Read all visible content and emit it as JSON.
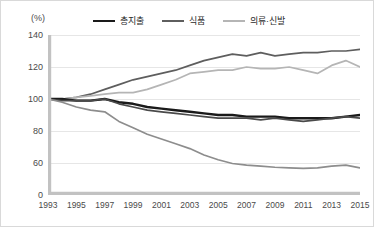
{
  "unit_label": "(%)",
  "legend": {
    "items": [
      {
        "label": "총지출",
        "color": "#1a1a1a",
        "width": 2.6
      },
      {
        "label": "식품",
        "color": "#5e5e5e",
        "width": 2.2
      },
      {
        "label": "의류·신발",
        "color": "#b5b5b5",
        "width": 2.0
      }
    ]
  },
  "axis": {
    "y_ticks": [
      "140",
      "120",
      "100",
      "80",
      "60",
      "0"
    ],
    "x_ticks": [
      "1993",
      "1995",
      "1997",
      "1999",
      "2001",
      "2003",
      "2005",
      "2007",
      "2009",
      "2011",
      "2013",
      "2015"
    ]
  },
  "chart_data": {
    "type": "line",
    "title": "",
    "subtitle": "",
    "xlabel": "",
    "ylabel": "(%)",
    "grid": true,
    "legend_position": "top",
    "ylim": [
      0,
      140
    ],
    "y_tick_values": [
      140,
      120,
      100,
      80,
      60,
      0
    ],
    "y_axis_note": "broken axis: ticks 140,120,100,80,60,0 are drawn at equal spacing",
    "x": [
      1993,
      1994,
      1995,
      1996,
      1997,
      1998,
      1999,
      2000,
      2001,
      2002,
      2003,
      2004,
      2005,
      2006,
      2007,
      2008,
      2009,
      2010,
      2011,
      2012,
      2013,
      2014,
      2015
    ],
    "x_tick_values": [
      1993,
      1995,
      1997,
      1999,
      2001,
      2003,
      2005,
      2007,
      2009,
      2011,
      2013,
      2015
    ],
    "series": [
      {
        "name": "주거·수도·광열",
        "color": "#5e5e5e",
        "labeled_in_legend": false,
        "values": [
          100,
          100,
          101,
          103,
          106,
          109,
          112,
          114,
          116,
          118,
          121,
          124,
          126,
          128,
          127,
          129,
          127,
          128,
          129,
          129,
          130,
          130,
          131
        ]
      },
      {
        "name": "식품",
        "color": "#b5b5b5",
        "labeled_in_legend": true,
        "values": [
          100,
          100,
          101,
          102,
          103,
          104,
          104,
          106,
          109,
          112,
          116,
          117,
          118,
          118,
          120,
          119,
          119,
          120,
          118,
          116,
          121,
          124,
          120
        ]
      },
      {
        "name": "총지출",
        "color": "#1a1a1a",
        "labeled_in_legend": true,
        "values": [
          100,
          100,
          99,
          99,
          100,
          98,
          97,
          95,
          94,
          93,
          92,
          91,
          90,
          90,
          89,
          89,
          89,
          88,
          88,
          88,
          88,
          89,
          90
        ]
      },
      {
        "name": "기타",
        "color": "#4a4a4a",
        "labeled_in_legend": false,
        "values": [
          100,
          99,
          99,
          99,
          100,
          97,
          95,
          93,
          92,
          91,
          90,
          89,
          88,
          88,
          88,
          87,
          88,
          87,
          86,
          87,
          88,
          89,
          88
        ]
      },
      {
        "name": "의류·신발",
        "color": "#8d8d8d",
        "labeled_in_legend": true,
        "values": [
          100,
          98,
          95,
          93,
          92,
          86,
          82,
          78,
          75,
          72,
          69,
          65,
          62,
          59,
          56,
          54,
          52,
          51,
          50,
          51,
          54,
          56,
          51
        ]
      }
    ]
  }
}
